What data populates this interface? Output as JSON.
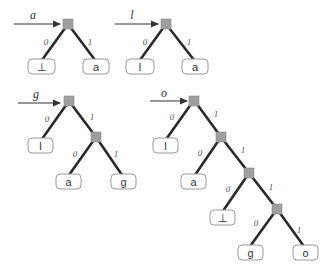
{
  "diagram": {
    "type": "binary trie insertion sequence",
    "edge_labels": {
      "left": "0",
      "right": "1"
    },
    "colors": {
      "edge": "#2a2a2a",
      "node": "#9e9e9e",
      "leaf_border": "#9a9a9a"
    },
    "trees": [
      {
        "input": "a",
        "leaves": [
          "⊥",
          "a"
        ]
      },
      {
        "input": "l",
        "leaves": [
          "l",
          "a"
        ]
      },
      {
        "input": "g",
        "leaves": [
          "l",
          "a",
          "g"
        ]
      },
      {
        "input": "o",
        "leaves": [
          "l",
          "a",
          "⊥",
          "g",
          "o"
        ]
      }
    ]
  }
}
